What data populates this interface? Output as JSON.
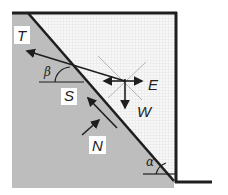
{
  "diagram": {
    "colors": {
      "soil": "#bdbdbd",
      "wall_fill": "#f2f2f2",
      "line": "#1e1e1e",
      "thin": "#8a8a8a"
    },
    "labels": {
      "T": "T",
      "beta": "β",
      "S": "S",
      "E": "E",
      "W": "W",
      "N": "N",
      "alpha": "α"
    },
    "forces": [
      {
        "name": "T",
        "description": "anchor/tie force"
      },
      {
        "name": "E",
        "description": "horizontal force"
      },
      {
        "name": "W",
        "description": "weight"
      },
      {
        "name": "S",
        "description": "shear force along slip plane"
      },
      {
        "name": "N",
        "description": "normal force on slip plane"
      }
    ],
    "angles": [
      {
        "name": "β",
        "description": "anchor inclination"
      },
      {
        "name": "α",
        "description": "slip plane inclination"
      }
    ]
  }
}
